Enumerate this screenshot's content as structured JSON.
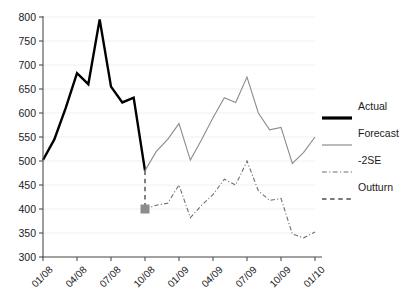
{
  "chart_data": {
    "type": "line",
    "title": "",
    "xlabel": "",
    "ylabel": "",
    "ylim": [
      300,
      800
    ],
    "ytick_step": 50,
    "yticks": [
      300,
      350,
      400,
      450,
      500,
      550,
      600,
      650,
      700,
      750,
      800
    ],
    "grid": true,
    "grid_axis": "y",
    "legend_position": "right",
    "x_tick_labels": [
      "01/08",
      "04/08",
      "07/08",
      "10/08",
      "01/09",
      "04/09",
      "07/09",
      "10/09",
      "01/10"
    ],
    "x_tick_values": [
      0,
      3,
      6,
      9,
      12,
      15,
      18,
      21,
      24
    ],
    "xlim": [
      0,
      24
    ],
    "series": [
      {
        "name": "Actual",
        "style": "solid",
        "color": "#000000",
        "width": 2.4,
        "x": [
          0,
          1,
          2,
          3,
          4,
          5,
          6,
          7,
          8,
          9
        ],
        "values": [
          502,
          545,
          610,
          683,
          660,
          795,
          655,
          622,
          632,
          480
        ]
      },
      {
        "name": "Forecast",
        "style": "solid",
        "color": "#8c8c8c",
        "width": 1.1,
        "x": [
          9,
          10,
          11,
          12,
          13,
          14,
          15,
          16,
          17,
          18,
          19,
          20,
          21,
          22,
          23,
          24
        ],
        "values": [
          480,
          520,
          545,
          578,
          502,
          545,
          590,
          632,
          622,
          675,
          600,
          565,
          570,
          495,
          518,
          550
        ]
      },
      {
        "name": "-2SE",
        "style": "dashdot",
        "color": "#6e6e6e",
        "width": 1.1,
        "x": [
          9,
          10,
          11,
          12,
          13,
          14,
          15,
          16,
          17,
          18,
          19,
          20,
          21,
          22,
          23,
          24
        ],
        "values": [
          400,
          408,
          412,
          450,
          382,
          408,
          430,
          462,
          450,
          500,
          438,
          418,
          422,
          348,
          340,
          352
        ]
      },
      {
        "name": "Outturn",
        "style": "dashed",
        "color": "#4d4d4d",
        "width": 1.4,
        "x": [
          9
        ],
        "values": [
          400
        ],
        "connector_from": [
          9,
          480
        ],
        "marker": "square",
        "marker_size": 9,
        "marker_color": "#8c8c8c"
      }
    ],
    "annotations": [
      {
        "name": "outturn-marker",
        "x": 9,
        "y": 400,
        "shape": "square",
        "color": "#8c8c8c"
      }
    ]
  },
  "legend": {
    "items": [
      {
        "label": "Actual",
        "style": "solid",
        "color": "#000000",
        "width": 3.2
      },
      {
        "label": "Forecast",
        "style": "solid",
        "color": "#8c8c8c",
        "width": 1.2
      },
      {
        "label": "-2SE",
        "style": "dashdot",
        "color": "#6e6e6e",
        "width": 1.2
      },
      {
        "label": "Outturn",
        "style": "dashed",
        "color": "#4d4d4d",
        "width": 1.4
      }
    ]
  },
  "colors": {
    "background": "#ffffff",
    "axis": "#4d4d4d",
    "gridline": "#f0f0f0",
    "text": "#1a1a1a"
  }
}
